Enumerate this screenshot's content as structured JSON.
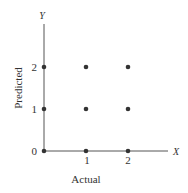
{
  "chart_data": {
    "type": "scatter",
    "title": "",
    "xlabel": "Actual",
    "ylabel": "Predicted",
    "x_axis_var": "X",
    "y_axis_var": "Y",
    "x_ticks": [
      "1",
      "2"
    ],
    "y_ticks": [
      "0",
      "1",
      "2"
    ],
    "xlim": [
      0,
      2
    ],
    "ylim": [
      0,
      2
    ],
    "grid": false,
    "points": [
      {
        "x": 0,
        "y": 0
      },
      {
        "x": 1,
        "y": 0
      },
      {
        "x": 2,
        "y": 0
      },
      {
        "x": 0,
        "y": 1
      },
      {
        "x": 1,
        "y": 1
      },
      {
        "x": 2,
        "y": 1
      },
      {
        "x": 0,
        "y": 2
      },
      {
        "x": 1,
        "y": 2
      },
      {
        "x": 2,
        "y": 2
      }
    ],
    "point_color": "#333333"
  }
}
